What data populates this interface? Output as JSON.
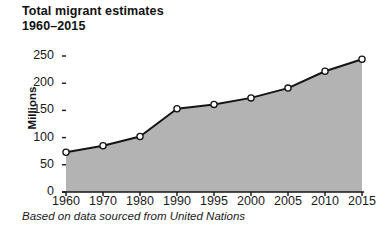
{
  "title": {
    "line1": "Total migrant estimates",
    "line2": "1960–2015"
  },
  "caption": "Based on data sourced from United Nations",
  "colors": {
    "area_fill": "#b3b3b3",
    "line": "#141414",
    "marker_fill": "#ffffff",
    "marker_stroke": "#141414",
    "axis": "#141414",
    "text": "#1a1a1a",
    "background": "#ffffff"
  },
  "chart_data": {
    "type": "area",
    "title": "Total migrant estimates 1960–2015",
    "subtitle": "1960–2015",
    "xlabel": "",
    "ylabel": "Millions",
    "categories": [
      "1960",
      "1970",
      "1980",
      "1990",
      "1995",
      "2000",
      "2005",
      "2010",
      "2015"
    ],
    "values": [
      73,
      85,
      102,
      153,
      161,
      173,
      191,
      222,
      244
    ],
    "series": [
      {
        "name": "Total migrant estimates",
        "values": [
          73,
          85,
          102,
          153,
          161,
          173,
          191,
          222,
          244
        ]
      }
    ],
    "ylim": [
      0,
      250
    ],
    "yticks": [
      0,
      50,
      100,
      150,
      200,
      250
    ],
    "ytick_labels": [
      "0",
      "50",
      "100",
      "150",
      "200",
      "250"
    ],
    "xtick_labels": [
      "1960",
      "1970",
      "1980",
      "1990",
      "1995",
      "2000",
      "2005",
      "2010",
      "2015"
    ],
    "grid": false,
    "legend": false,
    "legend_position": "none",
    "markers": "circle",
    "units": "Millions",
    "source_note": "Based on data sourced from United Nations"
  }
}
